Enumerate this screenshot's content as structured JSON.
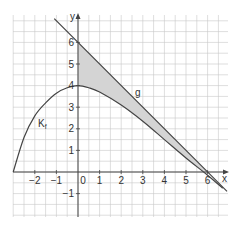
{
  "chart_data": {
    "type": "line",
    "title": "",
    "xlabel": "x",
    "ylabel": "y",
    "xlim": [
      -3.1,
      6.9
    ],
    "ylim": [
      -2.1,
      7.3
    ],
    "grid": true,
    "grid_step": 0.5,
    "x_ticks": [
      -2,
      -1,
      0,
      1,
      2,
      3,
      4,
      5,
      6
    ],
    "y_ticks": [
      -1,
      1,
      2,
      3,
      4,
      5,
      6
    ],
    "series": [
      {
        "name": "K_f",
        "label": "K",
        "subscript": "f",
        "description": "curve of f, starting at (-3,0), maximum at (0,4), decreasing towards (6,0)",
        "points": [
          [
            -3,
            0
          ],
          [
            -2.5,
            1.6
          ],
          [
            -2,
            2.6
          ],
          [
            -1.5,
            3.2
          ],
          [
            -1,
            3.65
          ],
          [
            -0.5,
            3.9
          ],
          [
            0,
            4
          ],
          [
            0.5,
            3.9
          ],
          [
            1,
            3.7
          ],
          [
            2,
            3.1
          ],
          [
            3,
            2.35
          ],
          [
            4,
            1.5
          ],
          [
            5,
            0.65
          ],
          [
            6,
            -0.15
          ],
          [
            6.7,
            -0.75
          ]
        ]
      },
      {
        "name": "g",
        "label": "g",
        "description": "line g: y = 6 - x",
        "points": [
          [
            -1.1,
            7.1
          ],
          [
            6.9,
            -0.9
          ]
        ]
      }
    ],
    "shaded_region": {
      "between": [
        "g",
        "K_f"
      ],
      "x_from": 0,
      "x_to": 6,
      "color": "#d4d4d4"
    }
  },
  "labels": {
    "x_axis": "x",
    "y_axis": "y",
    "curve_f_main": "K",
    "curve_f_sub": "f",
    "line_g": "g",
    "x_tick_labels": [
      "-2",
      "-1",
      "0",
      "1",
      "2",
      "3",
      "4",
      "5",
      "6"
    ],
    "y_tick_labels": [
      "-1",
      "1",
      "2",
      "3",
      "4",
      "5",
      "6"
    ]
  },
  "colors": {
    "grid": "#c8c8c8",
    "axis": "#444444",
    "curve": "#444444",
    "shade": "#d4d4d4"
  }
}
